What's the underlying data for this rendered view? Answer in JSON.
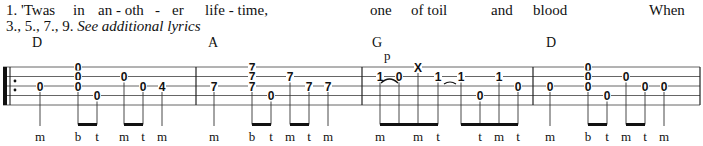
{
  "lyrics": {
    "line1": [
      {
        "text": "1. 'Twas",
        "x": 6
      },
      {
        "text": "in",
        "x": 73
      },
      {
        "text": "an - oth",
        "x": 98
      },
      {
        "text": "-",
        "x": 155
      },
      {
        "text": "er",
        "x": 172
      },
      {
        "text": "life - time,",
        "x": 205
      },
      {
        "text": "one",
        "x": 370
      },
      {
        "text": "of  toil",
        "x": 411
      },
      {
        "text": "and",
        "x": 491
      },
      {
        "text": "blood",
        "x": 533
      },
      {
        "text": "When",
        "x": 649
      }
    ],
    "line2_prefix": "3., 5., 7., 9.",
    "line2_italic": "See additional lyrics"
  },
  "chords": [
    {
      "name": "D",
      "x": 32
    },
    {
      "name": "A",
      "x": 208
    },
    {
      "name": "G",
      "x": 372
    },
    {
      "name": "D",
      "x": 546
    }
  ],
  "staff": {
    "lines_y": [
      67,
      76.5,
      86,
      95.5,
      105
    ],
    "x_start": 3,
    "x_end": 700,
    "barlines_x": [
      196,
      362,
      533,
      700
    ],
    "line_color": "#555555"
  },
  "technique": {
    "label": "p",
    "x": 384,
    "y": 60
  },
  "measures": [
    {
      "chord": "D",
      "notes": [
        {
          "x": 40,
          "frets": [
            {
              "s": 3,
              "v": "0"
            }
          ],
          "finger": "m"
        },
        {
          "x": 78,
          "frets": [
            {
              "s": 1,
              "v": "0"
            },
            {
              "s": 2,
              "v": "0"
            },
            {
              "s": 3,
              "v": "0"
            }
          ],
          "finger": "b"
        },
        {
          "x": 97,
          "frets": [
            {
              "s": 4,
              "v": "0"
            }
          ],
          "finger": "t"
        },
        {
          "x": 124,
          "frets": [
            {
              "s": 2,
              "v": "0"
            }
          ],
          "finger": "m"
        },
        {
          "x": 143,
          "frets": [
            {
              "s": 3,
              "v": "0"
            }
          ],
          "finger": "t"
        },
        {
          "x": 162,
          "frets": [
            {
              "s": 3,
              "v": "4"
            }
          ],
          "finger": "m"
        }
      ]
    },
    {
      "chord": "A",
      "notes": [
        {
          "x": 214,
          "frets": [
            {
              "s": 3,
              "v": "7"
            }
          ],
          "finger": "m"
        },
        {
          "x": 252,
          "frets": [
            {
              "s": 1,
              "v": "7"
            },
            {
              "s": 2,
              "v": "7"
            },
            {
              "s": 3,
              "v": "7"
            }
          ],
          "finger": "b"
        },
        {
          "x": 271,
          "frets": [
            {
              "s": 4,
              "v": "0"
            }
          ],
          "finger": "t"
        },
        {
          "x": 290,
          "frets": [
            {
              "s": 2,
              "v": "7"
            }
          ],
          "finger": "m"
        },
        {
          "x": 309,
          "frets": [
            {
              "s": 3,
              "v": "7"
            }
          ],
          "finger": "t"
        },
        {
          "x": 328,
          "frets": [
            {
              "s": 3,
              "v": "7"
            }
          ],
          "finger": "m"
        }
      ]
    },
    {
      "chord": "G",
      "notes": [
        {
          "x": 380,
          "frets": [
            {
              "s": 2,
              "v": "1"
            }
          ],
          "finger": "m"
        },
        {
          "x": 399,
          "frets": [
            {
              "s": 2,
              "v": "0"
            }
          ],
          "finger": ""
        },
        {
          "x": 418,
          "frets": [
            {
              "s": 1,
              "v": "X"
            }
          ],
          "finger": "m"
        },
        {
          "x": 438,
          "frets": [
            {
              "s": 2,
              "v": "1"
            }
          ],
          "finger": "t"
        },
        {
          "x": 461,
          "frets": [
            {
              "s": 2,
              "v": "1"
            }
          ],
          "finger": ""
        },
        {
          "x": 480,
          "frets": [
            {
              "s": 4,
              "v": "0"
            }
          ],
          "finger": "t"
        },
        {
          "x": 499,
          "frets": [
            {
              "s": 2,
              "v": "1"
            }
          ],
          "finger": "m"
        },
        {
          "x": 518,
          "frets": [
            {
              "s": 3,
              "v": "0"
            }
          ],
          "finger": "t"
        }
      ]
    },
    {
      "chord": "D",
      "notes": [
        {
          "x": 550,
          "frets": [
            {
              "s": 3,
              "v": "0"
            }
          ],
          "finger": "m"
        },
        {
          "x": 588,
          "frets": [
            {
              "s": 1,
              "v": "0"
            },
            {
              "s": 2,
              "v": "0"
            },
            {
              "s": 3,
              "v": "0"
            }
          ],
          "finger": "b"
        },
        {
          "x": 607,
          "frets": [
            {
              "s": 4,
              "v": "0"
            }
          ],
          "finger": "t"
        },
        {
          "x": 626,
          "frets": [
            {
              "s": 2,
              "v": "0"
            }
          ],
          "finger": "m"
        },
        {
          "x": 645,
          "frets": [
            {
              "s": 3,
              "v": "0"
            }
          ],
          "finger": "t"
        },
        {
          "x": 664,
          "frets": [
            {
              "s": 3,
              "v": "0"
            }
          ],
          "finger": "m"
        }
      ]
    }
  ],
  "beams": [
    {
      "x1": 78,
      "x2": 97
    },
    {
      "x1": 124,
      "x2": 143
    },
    {
      "x1": 252,
      "x2": 271
    },
    {
      "x1": 290,
      "x2": 309
    },
    {
      "x1": 380,
      "x2": 438
    },
    {
      "x1": 461,
      "x2": 518
    },
    {
      "x1": 588,
      "x2": 607
    },
    {
      "x1": 626,
      "x2": 645
    }
  ],
  "slurs": [
    {
      "x1": 380,
      "x2": 399,
      "y": 83,
      "type": "pull-off"
    },
    {
      "x1": 443,
      "x2": 457,
      "y": 84,
      "type": "tie"
    }
  ],
  "repeat_dots_y": [
    81,
    90
  ]
}
